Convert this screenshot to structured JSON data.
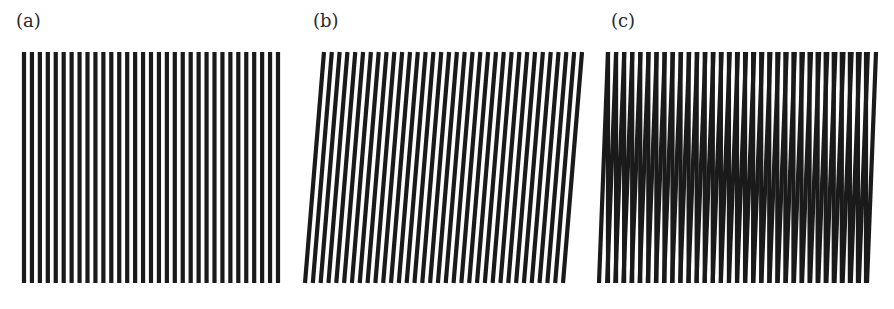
{
  "figure": {
    "panels": [
      {
        "id": "a",
        "label": "(a)",
        "description": "Grating of vertical parallel black lines",
        "line_count": 33,
        "orientation": "vertical"
      },
      {
        "id": "b",
        "label": "(b)",
        "description": "Same grating slightly rotated (lines tilted)",
        "line_count": 34,
        "orientation": "tilted"
      },
      {
        "id": "c",
        "label": "(c)",
        "description": "Superposition of (a) and (b) producing moire fringes",
        "line_count": 33,
        "orientation": "overlay"
      }
    ],
    "line_color": "#1a1a1a"
  }
}
